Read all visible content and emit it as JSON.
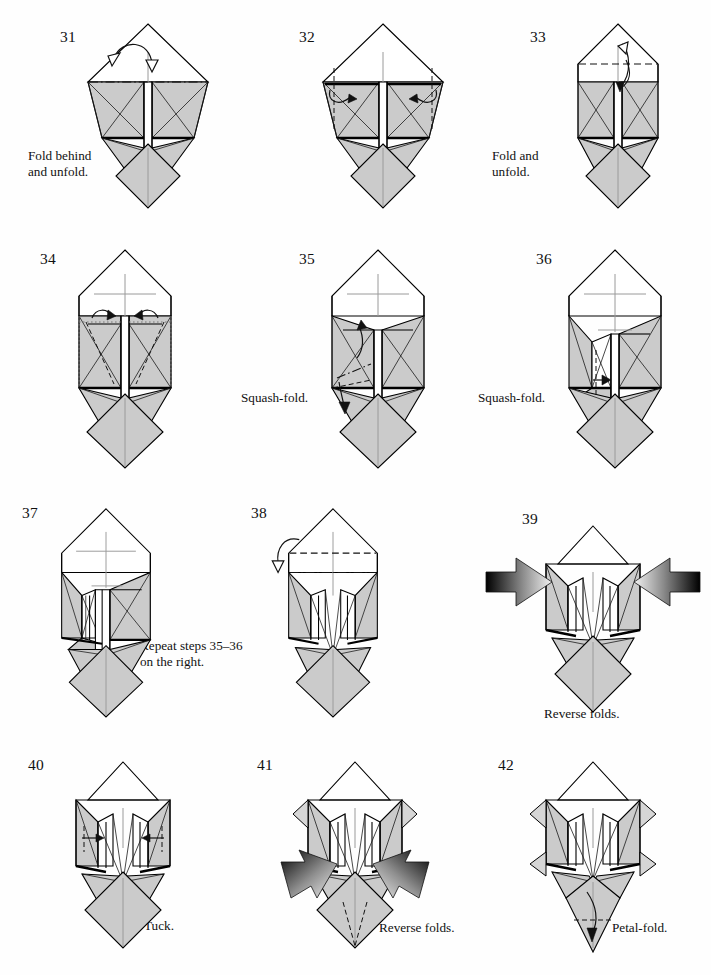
{
  "page": {
    "background_color": "#ffffff",
    "paper_gray": "#cbcbcb",
    "line_color": "#000000",
    "crease_color": "#9a9a9a",
    "columns": 3,
    "rows": 4
  },
  "steps": [
    {
      "number": "31",
      "caption": "Fold behind\nand unfold.",
      "caption_position": "left-below",
      "model": "base-31",
      "notes": "mountain-fold line across the top of the shaded panels; hollow double arrow over and back"
    },
    {
      "number": "32",
      "caption": "",
      "caption_position": "none",
      "model": "base-32",
      "notes": "two vertical dashed valley folds at the outer edges with curling arrows pointing inward"
    },
    {
      "number": "33",
      "caption": "Fold and\nunfold.",
      "caption_position": "left-below",
      "model": "base-33",
      "notes": "horizontal dashed valley fold across the white upper band; hollow arrow up and solid arrow down"
    },
    {
      "number": "34",
      "caption": "",
      "caption_position": "none",
      "model": "base-34",
      "notes": "dotted hidden edges and dashed valley folds inside both shaded panels; two small curling arrows inward"
    },
    {
      "number": "35",
      "caption": "Squash-fold.",
      "caption_position": "left-below",
      "model": "base-35",
      "notes": "squash fold on the left panel; short dash-dot line and a downward arrow"
    },
    {
      "number": "36",
      "caption": "Squash-fold.",
      "caption_position": "left-below",
      "model": "base-36",
      "notes": "left panel squashed open; dashed vertical fold with small arrow to the right"
    },
    {
      "number": "37",
      "caption": "Repeat steps 35–36\non the right.",
      "caption_position": "right-below",
      "model": "base-37",
      "notes": "left side completed; repeat instruction applies to right side"
    },
    {
      "number": "38",
      "caption": "",
      "caption_position": "none",
      "model": "base-38",
      "notes": "horizontal dashed valley fold near the top and a dash-dot mountain line; hollow arrow curling behind"
    },
    {
      "number": "39",
      "caption": "Reverse folds.",
      "caption_position": "center-below",
      "model": "base-39",
      "notes": "two large gradient push arrows aimed inward from the left and right sides"
    },
    {
      "number": "40",
      "caption": "Tuck.",
      "caption_position": "right-below",
      "model": "base-40",
      "notes": "small arrows tucking flaps inward on both sides"
    },
    {
      "number": "41",
      "caption": "Reverse folds.",
      "caption_position": "right-below",
      "model": "base-41",
      "notes": "two large gradient push arrows pointing down and inward; dashed fold lines on the lower diamond"
    },
    {
      "number": "42",
      "caption": "Petal-fold.",
      "caption_position": "right-below",
      "model": "base-42",
      "notes": "lower point narrowed; dashed horizontal fold with a downward arrow on the bottom point"
    }
  ]
}
